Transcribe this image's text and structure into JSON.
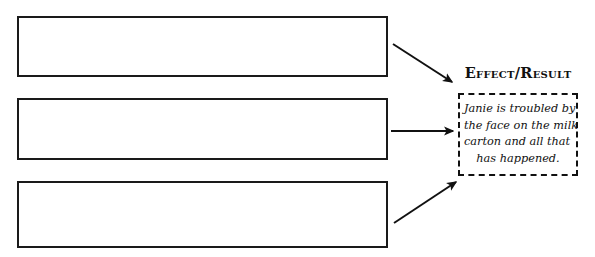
{
  "diagram": {
    "type": "cause-and-effect-graphic-organizer",
    "cause_boxes": [
      {
        "id": "cause-1",
        "text": ""
      },
      {
        "id": "cause-2",
        "text": ""
      },
      {
        "id": "cause-3",
        "text": ""
      }
    ],
    "effect": {
      "heading": "Effect/Result",
      "text_lines": [
        "Janie is troubled by",
        "the face on the milk",
        "carton and all that",
        "has happened."
      ],
      "full_text": "Janie is troubled by the face on the milk carton and all that has happened."
    },
    "arrows": [
      {
        "id": "arrow-1",
        "from": "cause-1",
        "to": "effect",
        "direction": "down-right"
      },
      {
        "id": "arrow-2",
        "from": "cause-2",
        "to": "effect",
        "direction": "right"
      },
      {
        "id": "arrow-3",
        "from": "cause-3",
        "to": "effect",
        "direction": "up-right"
      }
    ],
    "colors": {
      "stroke": "#1a1a1a",
      "text": "#111111",
      "background": "#ffffff"
    }
  }
}
